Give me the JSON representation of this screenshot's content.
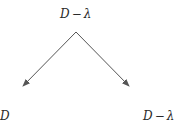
{
  "diagram": {
    "top_node": {
      "var": "D",
      "op": "−",
      "sym": "λ"
    },
    "left_node": {
      "var": "D"
    },
    "right_node": {
      "var": "D",
      "op": "−",
      "sym": "λ"
    },
    "edges": [
      {
        "from": "top_node",
        "to": "left_node",
        "style": "arrow"
      },
      {
        "from": "top_node",
        "to": "right_node",
        "style": "arrow"
      }
    ],
    "colors": {
      "line": "#555555",
      "text": "#2a2a2a",
      "background": "#ffffff"
    }
  }
}
